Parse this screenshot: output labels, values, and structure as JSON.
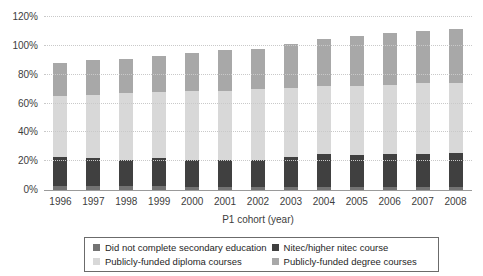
{
  "chart_data": {
    "type": "bar",
    "stacked": true,
    "title": "",
    "xlabel": "P1 cohort (year)",
    "ylabel": "",
    "ylim": [
      0,
      120
    ],
    "ytick_step": 20,
    "ytick_labels": [
      "0%",
      "20%",
      "40%",
      "60%",
      "80%",
      "100%",
      "120%"
    ],
    "grid": true,
    "legend_position": "bottom-boxed",
    "categories": [
      "1996",
      "1997",
      "1998",
      "1999",
      "2000",
      "2001",
      "2002",
      "2003",
      "2004",
      "2005",
      "2006",
      "2007",
      "2008"
    ],
    "series": [
      {
        "name": "Did not complete secondary education",
        "color": "#737373",
        "values": [
          3,
          3,
          3,
          3,
          2,
          2,
          2,
          2,
          2,
          2,
          2,
          2,
          2
        ]
      },
      {
        "name": "Nitec/higher nitec course",
        "color": "#404040",
        "values": [
          20,
          19,
          18,
          19,
          19,
          19,
          19,
          21,
          23,
          22,
          23,
          23,
          24
        ]
      },
      {
        "name": "Publicly-funded diploma courses",
        "color": "#d8d8d8",
        "values": [
          42,
          44,
          46,
          46,
          48,
          48,
          49,
          48,
          47,
          48,
          48,
          49,
          48
        ]
      },
      {
        "name": "Publicly-funded degree courses",
        "color": "#a8a8a8",
        "values": [
          23,
          24,
          24,
          25,
          26,
          28,
          28,
          30,
          33,
          35,
          36,
          36,
          38
        ]
      }
    ],
    "stacked_totals": [
      88,
      90,
      91,
      93,
      95,
      97,
      98,
      101,
      105,
      107,
      109,
      110,
      112
    ]
  }
}
